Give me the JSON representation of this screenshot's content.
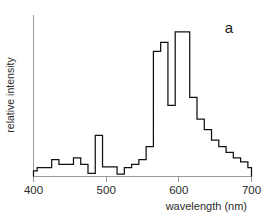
{
  "chart_data": {
    "type": "area",
    "render_style": "step-histogram",
    "title": "",
    "panel_label": "a",
    "xlabel": "wavelength (nm)",
    "ylabel": "relative intensity",
    "xlim": [
      400,
      700
    ],
    "ylim": [
      0,
      1.0
    ],
    "xticks": [
      400,
      500,
      600,
      700
    ],
    "xtick_labels": [
      "400",
      "500",
      "600",
      "700"
    ],
    "yticks": [],
    "ytick_labels": [],
    "grid": false,
    "legend": null,
    "bin_width_nm": 10,
    "x": [
      400,
      410,
      420,
      430,
      440,
      450,
      460,
      470,
      480,
      490,
      500,
      510,
      520,
      530,
      540,
      550,
      560,
      570,
      580,
      590,
      600,
      610,
      620,
      630,
      640,
      650,
      660,
      670,
      680,
      690,
      700
    ],
    "values": [
      0.035,
      0.055,
      0.055,
      0.105,
      0.075,
      0.075,
      0.115,
      0.075,
      0.02,
      0.255,
      0.06,
      0.06,
      0.015,
      0.055,
      0.075,
      0.105,
      0.185,
      0.775,
      0.83,
      0.44,
      0.895,
      0.895,
      0.49,
      0.355,
      0.29,
      0.225,
      0.185,
      0.15,
      0.115,
      0.09,
      0.055
    ],
    "axis_color": "#9a9a9a",
    "trace_color": "#121212",
    "background": "#ffffff"
  },
  "figure": {
    "panel_label": "a",
    "xlabel": "wavelength (nm)",
    "ylabel": "relative intensity",
    "xtick_labels": [
      "400",
      "500",
      "600",
      "700"
    ]
  }
}
